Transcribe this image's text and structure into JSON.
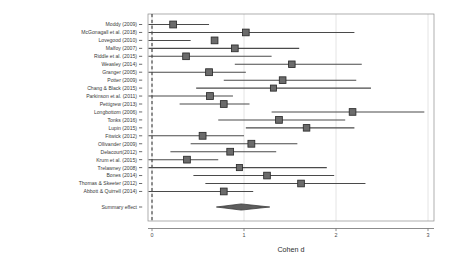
{
  "chart_data": {
    "type": "scatter",
    "subtype": "forest-plot",
    "title": "",
    "xlabel": "Cohen d",
    "ylabel": "",
    "xlim": [
      -0.55,
      3.25
    ],
    "xticks": [
      0,
      1,
      2,
      3
    ],
    "xticklabels": [
      "0",
      "1",
      "2",
      "3"
    ],
    "grid": "vertical-gridlines-at-ticks",
    "legend": "none",
    "reference_line": {
      "value": 0,
      "style": "dashed"
    },
    "categories": [
      "Moddy (2009)",
      "McGonagall et al. (2018)",
      "Lovegood (2010)",
      "Malfoy (2007)",
      "Riddle et al. (2015)",
      "Weasley (2014)",
      "Granger (2005)",
      "Potter (2009)",
      "Chang & Black (2015)",
      "Parkinson et al. (2011)",
      "Pettigrew (2013)",
      "Longbottom (2006)",
      "Tonks (2016)",
      "Lupin (2015)",
      "Fitwick (2012)",
      "Ollivander (2009)",
      "Delacourt (2012)",
      "Krum et al. (2015)",
      "Trelawney (2008)",
      "Bones (2014)",
      "Thomas & Skeeter (2012)",
      "Abbott & Quirrell (2014)"
    ],
    "effect_label": "Cohen d",
    "studies": [
      {
        "label": "Moddy (2009)",
        "effect": 0.23,
        "ci_low": -0.52,
        "ci_high": 0.62,
        "weight": 0.62
      },
      {
        "label": "McGonagall et al. (2018)",
        "effect": 1.02,
        "ci_low": -0.05,
        "ci_high": 2.2,
        "weight": 0.58
      },
      {
        "label": "Lovegood (2010)",
        "effect": 0.68,
        "ci_low": -0.27,
        "ci_high": 0.42,
        "weight": 0.6
      },
      {
        "label": "Malfoy (2007)",
        "effect": 0.9,
        "ci_low": -0.82,
        "ci_high": 1.6,
        "weight": 0.6
      },
      {
        "label": "Riddle et al. (2015)",
        "effect": 0.37,
        "ci_low": -0.95,
        "ci_high": 1.3,
        "weight": 0.58
      },
      {
        "label": "Weasley (2014)",
        "effect": 1.52,
        "ci_low": 0.9,
        "ci_high": 2.28,
        "weight": 0.55
      },
      {
        "label": "Granger (2005)",
        "effect": 0.62,
        "ci_low": -0.9,
        "ci_high": 1.02,
        "weight": 0.62
      },
      {
        "label": "Potter (2009)",
        "effect": 1.42,
        "ci_low": 0.78,
        "ci_high": 2.22,
        "weight": 0.58
      },
      {
        "label": "Chang & Black (2015)",
        "effect": 1.32,
        "ci_low": 0.48,
        "ci_high": 2.38,
        "weight": 0.45
      },
      {
        "label": "Parkinson et al. (2011)",
        "effect": 0.63,
        "ci_low": -0.88,
        "ci_high": 0.88,
        "weight": 0.62
      },
      {
        "label": "Pettigrew (2013)",
        "effect": 0.78,
        "ci_low": 0.3,
        "ci_high": 1.06,
        "weight": 0.6
      },
      {
        "label": "Longbottom (2006)",
        "effect": 2.18,
        "ci_low": 1.3,
        "ci_high": 2.96,
        "weight": 0.58
      },
      {
        "label": "Tonks (2016)",
        "effect": 1.38,
        "ci_low": 0.72,
        "ci_high": 2.1,
        "weight": 0.6
      },
      {
        "label": "Lupin (2015)",
        "effect": 1.68,
        "ci_low": 1.02,
        "ci_high": 2.2,
        "weight": 0.55
      },
      {
        "label": "Fitwick (2012)",
        "effect": 0.55,
        "ci_low": -0.7,
        "ci_high": 1.0,
        "weight": 0.62
      },
      {
        "label": "Ollivander (2009)",
        "effect": 1.08,
        "ci_low": 0.42,
        "ci_high": 1.58,
        "weight": 0.62
      },
      {
        "label": "Delacourt(2012)",
        "effect": 0.85,
        "ci_low": 0.2,
        "ci_high": 1.35,
        "weight": 0.6
      },
      {
        "label": "Krum et al. (2015)",
        "effect": 0.38,
        "ci_low": -0.65,
        "ci_high": 0.72,
        "weight": 0.6
      },
      {
        "label": "Trelawney (2008)",
        "effect": 0.95,
        "ci_low": -0.9,
        "ci_high": 1.9,
        "weight": 0.45
      },
      {
        "label": "Bones (2014)",
        "effect": 1.25,
        "ci_low": 0.45,
        "ci_high": 1.98,
        "weight": 0.58
      },
      {
        "label": "Thomas & Skeeter (2012)",
        "effect": 1.62,
        "ci_low": 0.58,
        "ci_high": 2.32,
        "weight": 0.58
      },
      {
        "label": "Abbott & Quirrell (2014)",
        "effect": 0.78,
        "ci_low": -0.1,
        "ci_high": 1.1,
        "weight": 0.6
      }
    ],
    "summary": {
      "label": "Summary effect",
      "effect": 0.97,
      "ci_low": 0.7,
      "ci_high": 1.28,
      "shape": "diamond"
    }
  }
}
